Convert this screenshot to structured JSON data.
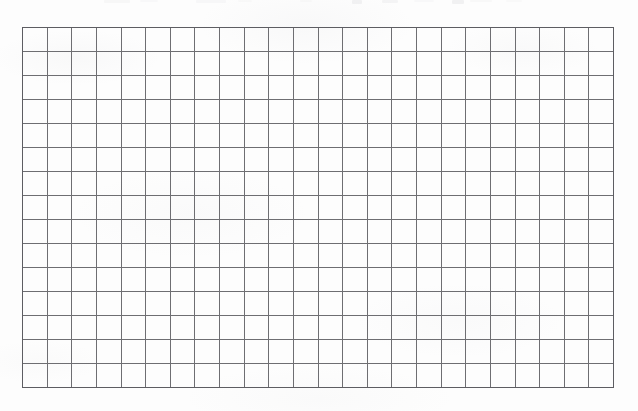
{
  "document": {
    "kind": "scanned-blank-grid-sheet",
    "description": "Blank grid / graph-paper table scanned from a printed page",
    "page_width": 638,
    "page_height": 411,
    "background_color": "#fdfdfd"
  },
  "grid": {
    "columns": 24,
    "rows": 15,
    "left": 22,
    "top": 27,
    "width": 592,
    "height": 361,
    "cell_width": 24.7,
    "cell_height": 24.1,
    "line_color": "#6e6e72",
    "border_color": "#5d5d62",
    "line_width_px": 1,
    "cells_filled": 0,
    "cell_text": ""
  },
  "artifacts": {
    "top_text_remnant_label": "clipped text descenders at top edge of scan",
    "smudges": [
      {
        "left": 104,
        "width": 26,
        "height": 3,
        "opacity": 0.16
      },
      {
        "left": 140,
        "width": 18,
        "height": 2,
        "opacity": 0.12
      },
      {
        "left": 196,
        "width": 30,
        "height": 3,
        "opacity": 0.14
      },
      {
        "left": 238,
        "width": 14,
        "height": 2,
        "opacity": 0.1
      },
      {
        "left": 300,
        "width": 12,
        "height": 2,
        "opacity": 0.1
      },
      {
        "left": 352,
        "width": 10,
        "height": 4,
        "opacity": 0.26
      },
      {
        "left": 382,
        "width": 16,
        "height": 3,
        "opacity": 0.22
      },
      {
        "left": 414,
        "width": 20,
        "height": 2,
        "opacity": 0.12
      },
      {
        "left": 452,
        "width": 12,
        "height": 4,
        "opacity": 0.3
      },
      {
        "left": 470,
        "width": 22,
        "height": 2,
        "opacity": 0.13
      },
      {
        "left": 506,
        "width": 16,
        "height": 2,
        "opacity": 0.11
      }
    ]
  }
}
